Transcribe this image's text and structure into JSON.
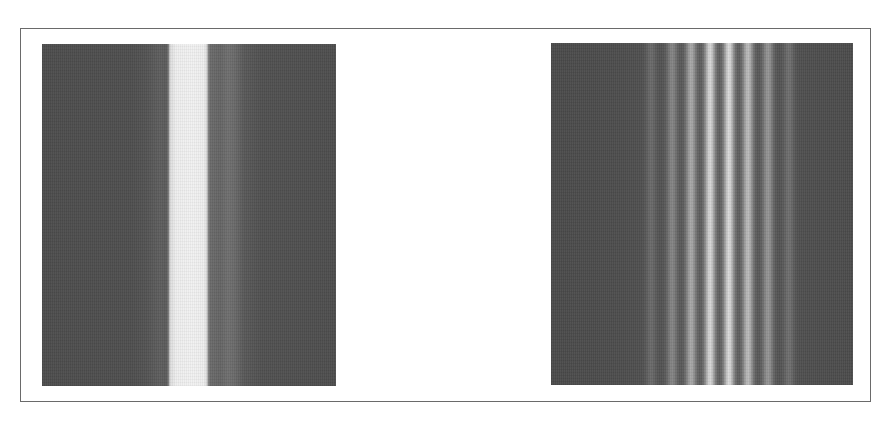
{
  "figure": {
    "panels": [
      {
        "id": "left",
        "label": "single-slit-pattern",
        "background_color": "#4c4c4c",
        "central_band_color": "#f0f0f0",
        "secondary_band_color": "#646464"
      },
      {
        "id": "right",
        "label": "multi-fringe-pattern",
        "background_color": "#4a4a4a",
        "fringes": [
          {
            "center": 100,
            "intensity": 0.15
          },
          {
            "center": 121,
            "intensity": 0.3
          },
          {
            "center": 140,
            "intensity": 0.5
          },
          {
            "center": 159,
            "intensity": 0.78
          },
          {
            "center": 178,
            "intensity": 0.8
          },
          {
            "center": 197,
            "intensity": 0.62
          },
          {
            "center": 217,
            "intensity": 0.4
          },
          {
            "center": 238,
            "intensity": 0.18
          }
        ]
      }
    ],
    "frame_border_color": "#6a6a6a"
  }
}
